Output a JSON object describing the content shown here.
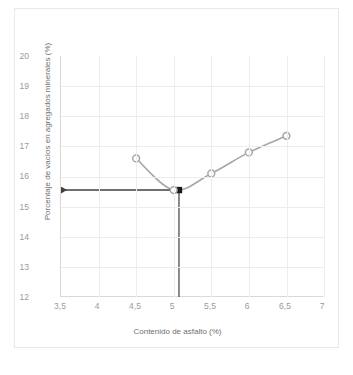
{
  "chart_data": {
    "type": "line",
    "title": "",
    "xlabel": "Contenido de asfalto (%)",
    "ylabel": "Porcentaje  de vacíos en agregados minerales (%)",
    "x": [
      4.5,
      5.0,
      5.5,
      6.0,
      6.5
    ],
    "values": [
      16.6,
      15.55,
      16.1,
      16.8,
      17.35
    ],
    "series": [
      {
        "name": "VAM",
        "x": [
          4.5,
          5.0,
          5.5,
          6.0,
          6.5
        ],
        "values": [
          16.6,
          15.55,
          16.1,
          16.8,
          17.35
        ]
      }
    ],
    "xlim": [
      3.5,
      7
    ],
    "ylim": [
      12,
      20
    ],
    "xticks": [
      "3,5",
      "4",
      "4,5",
      "5",
      "5,5",
      "6",
      "6,5",
      "7"
    ],
    "xtick_values": [
      3.5,
      4,
      4.5,
      5,
      5.5,
      6,
      6.5,
      7
    ],
    "yticks": [
      "12",
      "13",
      "14",
      "15",
      "16",
      "17",
      "18",
      "19",
      "20"
    ],
    "ytick_values": [
      12,
      13,
      14,
      15,
      16,
      17,
      18,
      19,
      20
    ],
    "grid": true,
    "legend": "none",
    "line_color": "#a6a6a6",
    "marker_color": "#a6a6a6",
    "marker_fill": "#ffffff",
    "annotation_color": "#404040",
    "annotations": [
      {
        "name": "minimum-vam-readout",
        "type": "leader-lines",
        "x": 5.07,
        "y": 15.55,
        "horizontal_from_x": 3.5,
        "vertical_to_y": 12,
        "arrow_left": true,
        "arrow_down": false
      }
    ]
  },
  "figure": {
    "caption": ""
  }
}
